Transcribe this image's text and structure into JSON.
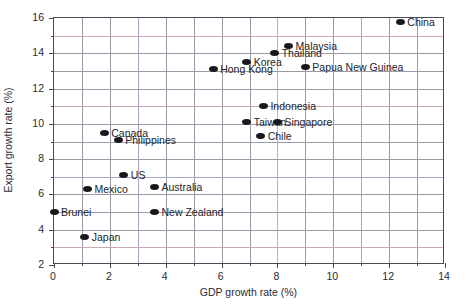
{
  "chart_data": {
    "type": "scatter",
    "title": "",
    "xlabel": "GDP growth rate (%)",
    "ylabel": "Export growth rate (%)",
    "xlim": [
      0,
      14
    ],
    "ylim": [
      2,
      16
    ],
    "xticks": [
      0,
      2,
      4,
      6,
      8,
      10,
      12,
      14
    ],
    "yticks": [
      2,
      4,
      6,
      8,
      10,
      12,
      14,
      16
    ],
    "xtick_labels": [
      "0",
      "2",
      "4",
      "6",
      "8",
      "10",
      "12",
      "14"
    ],
    "ytick_labels": [
      "2",
      "4",
      "6",
      "8",
      "10",
      "12",
      "14",
      "16"
    ],
    "x_minor_step": 1,
    "y_minor_step": 1,
    "grid": true,
    "grid_axis": "both",
    "legend": false,
    "marker": "ellipse",
    "marker_color": "#17171c",
    "points": [
      {
        "label": "China",
        "x": 12.4,
        "y": 15.8,
        "label_side": "right"
      },
      {
        "label": "Malaysia",
        "x": 8.4,
        "y": 14.4,
        "label_side": "right"
      },
      {
        "label": "Thailand",
        "x": 7.9,
        "y": 14.0,
        "label_side": "right"
      },
      {
        "label": "Korea",
        "x": 6.9,
        "y": 13.5,
        "label_side": "right"
      },
      {
        "label": "Papua New Guinea",
        "x": 9.0,
        "y": 13.2,
        "label_side": "right"
      },
      {
        "label": "Hong Kong",
        "x": 5.7,
        "y": 13.1,
        "label_side": "right"
      },
      {
        "label": "Indonesia",
        "x": 7.5,
        "y": 11.0,
        "label_side": "right"
      },
      {
        "label": "Taiwan",
        "x": 6.9,
        "y": 10.1,
        "label_side": "right"
      },
      {
        "label": "Singapore",
        "x": 8.0,
        "y": 10.1,
        "label_side": "right"
      },
      {
        "label": "Chile",
        "x": 7.4,
        "y": 9.3,
        "label_side": "right"
      },
      {
        "label": "Canada",
        "x": 1.8,
        "y": 9.5,
        "label_side": "right"
      },
      {
        "label": "Philippines",
        "x": 2.3,
        "y": 9.1,
        "label_side": "right"
      },
      {
        "label": "US",
        "x": 2.5,
        "y": 7.1,
        "label_side": "right"
      },
      {
        "label": "Australia",
        "x": 3.6,
        "y": 6.4,
        "label_side": "right"
      },
      {
        "label": "Mexico",
        "x": 1.2,
        "y": 6.3,
        "label_side": "right"
      },
      {
        "label": "Brunei",
        "x": 0.0,
        "y": 5.0,
        "label_side": "right"
      },
      {
        "label": "New Zealand",
        "x": 3.6,
        "y": 5.0,
        "label_side": "right"
      },
      {
        "label": "Japan",
        "x": 1.1,
        "y": 3.6,
        "label_side": "right"
      }
    ]
  }
}
